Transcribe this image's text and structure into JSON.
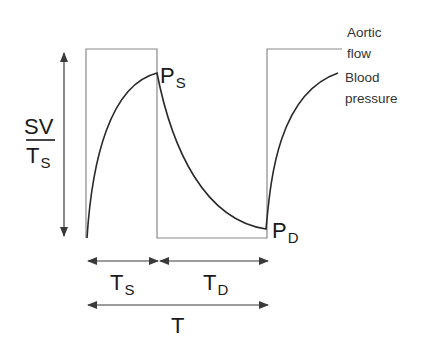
{
  "diagram": {
    "type": "waveform-timing-diagram",
    "colors": {
      "aortic_flow_line": "#8a8a8a",
      "pressure_curve": "#2a2a2a",
      "arrows": "#3a3a3a",
      "text": "#1a1a1a"
    },
    "legend": {
      "aortic_flow": [
        "Aortic",
        "flow"
      ],
      "blood_pressure": [
        "Blood",
        "pressure"
      ]
    },
    "y_axis": {
      "label_numerator": "SV",
      "label_denominator_main": "T",
      "label_denominator_sub": "S"
    },
    "points": {
      "systolic": {
        "main": "P",
        "sub": "S"
      },
      "diastolic": {
        "main": "P",
        "sub": "D"
      }
    },
    "intervals": {
      "systole": {
        "main": "T",
        "sub": "S"
      },
      "diastole": {
        "main": "T",
        "sub": "D"
      },
      "period": {
        "main": "T"
      }
    }
  }
}
